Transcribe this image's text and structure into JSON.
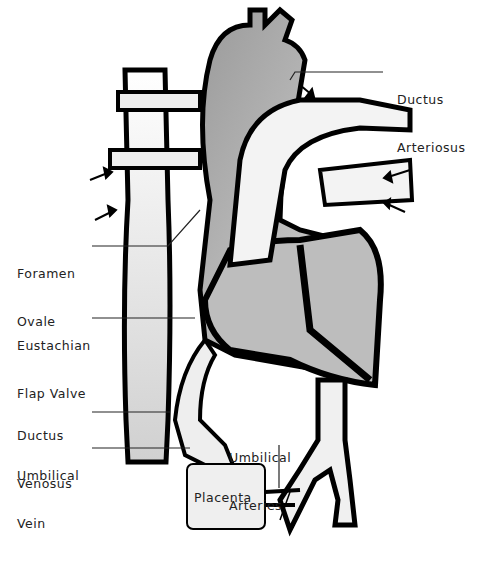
{
  "diagram": {
    "labels": {
      "ductus_arteriosus": [
        "Ductus",
        "Arteriosus"
      ],
      "foramen_ovale": [
        "Foramen",
        "Ovale"
      ],
      "eustachian_flap_valve": [
        "Eustachian",
        "Flap Valve"
      ],
      "ductus_venosus": [
        "Ductus",
        "Venosus"
      ],
      "umbilical_vein": [
        "Umbilical",
        "Vein"
      ],
      "umbilical_arteries": [
        "Umbilical",
        "Arteries"
      ],
      "placenta": "Placenta"
    },
    "colors": {
      "outline": "#000000",
      "fill_gray": "#b8b8b8",
      "fill_light": "#f2f2f2",
      "background": "#ffffff"
    }
  }
}
